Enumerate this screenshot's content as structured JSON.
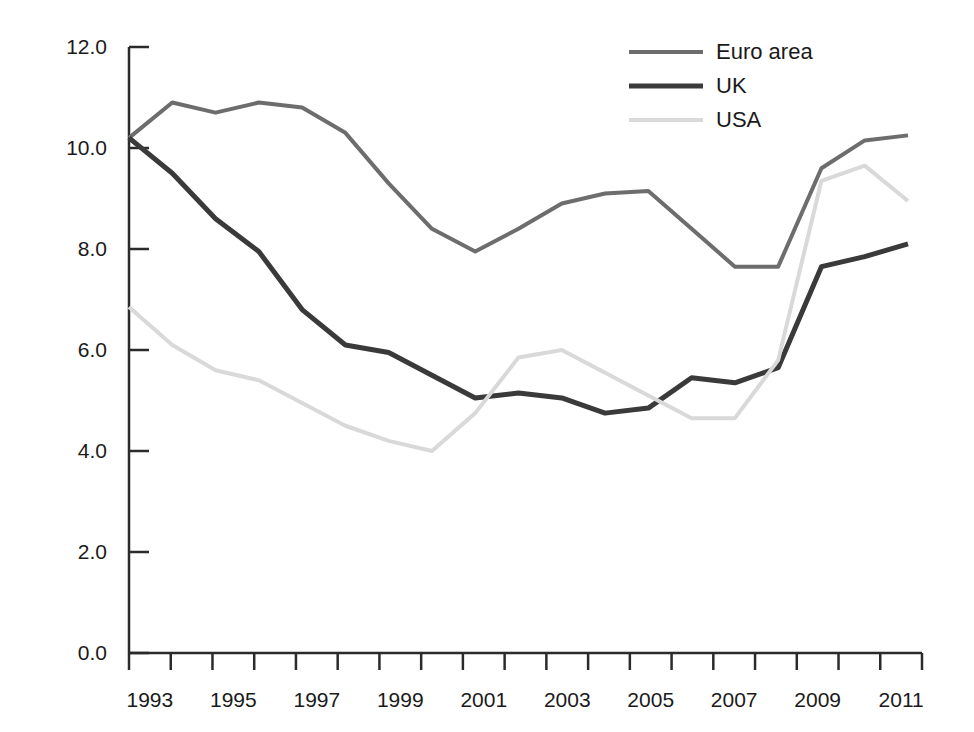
{
  "chart_data": {
    "type": "line",
    "title": "",
    "subtitle": "",
    "xlabel": "",
    "ylabel": "",
    "x": [
      1993,
      1994,
      1995,
      1996,
      1997,
      1998,
      1999,
      2000,
      2001,
      2002,
      2003,
      2004,
      2005,
      2006,
      2007,
      2008,
      2009,
      2010,
      2011
    ],
    "xlim": [
      1993,
      2011
    ],
    "ylim": [
      0.0,
      12.0
    ],
    "ytick_values": [
      0.0,
      2.0,
      4.0,
      6.0,
      8.0,
      10.0,
      12.0
    ],
    "ytick_labels": [
      "0.0",
      "2.0",
      "4.0",
      "6.0",
      "8.0",
      "10.0",
      "12.0"
    ],
    "xtick_values": [
      1993,
      1995,
      1997,
      1999,
      2001,
      2003,
      2005,
      2007,
      2009,
      2011
    ],
    "xtick_labels": [
      "1993",
      "1995",
      "1997",
      "1999",
      "2001",
      "2003",
      "2005",
      "2007",
      "2009",
      "2011"
    ],
    "xtick_minor_values": [
      1994,
      1996,
      1998,
      2000,
      2002,
      2004,
      2006,
      2008,
      2010
    ],
    "grid": false,
    "legend_position": "top-right",
    "series": [
      {
        "name": "Euro area",
        "color": "#6d6d6d",
        "width": 4,
        "values": [
          10.2,
          10.9,
          10.7,
          10.9,
          10.8,
          10.3,
          9.3,
          8.4,
          7.95,
          8.4,
          8.9,
          9.1,
          9.15,
          8.4,
          7.65,
          7.65,
          9.6,
          10.15,
          10.25
        ]
      },
      {
        "name": "UK",
        "color": "#3a3a3a",
        "width": 5,
        "values": [
          10.2,
          9.5,
          8.6,
          7.95,
          6.8,
          6.1,
          5.95,
          5.5,
          5.05,
          5.15,
          5.05,
          4.75,
          4.85,
          5.45,
          5.35,
          5.65,
          7.65,
          7.85,
          8.1
        ]
      },
      {
        "name": "USA",
        "color": "#d9d9d9",
        "width": 4,
        "values": [
          6.85,
          6.1,
          5.6,
          5.4,
          4.95,
          4.5,
          4.2,
          4.0,
          4.75,
          5.85,
          6.0,
          5.55,
          5.1,
          4.65,
          4.65,
          5.8,
          9.35,
          9.65,
          8.95
        ]
      }
    ]
  },
  "legend": {
    "items": [
      {
        "label": "Euro area",
        "color": "#6d6d6d",
        "width": 4
      },
      {
        "label": "UK",
        "color": "#3a3a3a",
        "width": 5
      },
      {
        "label": "USA",
        "color": "#d9d9d9",
        "width": 4
      }
    ]
  },
  "axes": {
    "y_axis_color": "#2b2b2b",
    "x_axis_color": "#2b2b2b"
  }
}
